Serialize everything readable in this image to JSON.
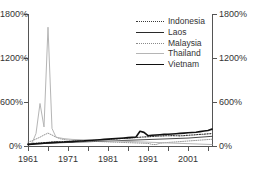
{
  "chart_data": {
    "type": "line",
    "title": "",
    "xlabel": "",
    "ylabel": "",
    "xlim": [
      1961,
      2007
    ],
    "ylim": [
      0,
      1800
    ],
    "grid": false,
    "legend_position": "top-right",
    "y_unit": "%",
    "y_ticks": [
      0,
      600,
      1200,
      1800
    ],
    "y_tick_labels_left": [
      "0%",
      "600%",
      "1200%",
      "1800%"
    ],
    "y_tick_labels_right": [
      "0%",
      "600%",
      "1200%",
      "1800%"
    ],
    "x_ticks": [
      1961,
      1966,
      1971,
      1976,
      1981,
      1986,
      1991,
      1996,
      2001,
      2006
    ],
    "x_tick_labels": [
      "1961",
      "",
      "1971",
      "",
      "1981",
      "",
      "1991",
      "",
      "2001",
      ""
    ],
    "x_labels_shown": [
      "1961",
      "1971",
      "1981",
      "1991",
      "2001"
    ],
    "x": [
      1961,
      1962,
      1963,
      1964,
      1965,
      1966,
      1967,
      1968,
      1969,
      1970,
      1971,
      1972,
      1973,
      1974,
      1975,
      1976,
      1977,
      1978,
      1979,
      1980,
      1981,
      1982,
      1983,
      1984,
      1985,
      1986,
      1987,
      1988,
      1989,
      1990,
      1991,
      1992,
      1993,
      1994,
      1995,
      1996,
      1997,
      1998,
      1999,
      2000,
      2001,
      2002,
      2003,
      2004,
      2005,
      2006,
      2007
    ],
    "series": [
      {
        "name": "Indonesia",
        "style": "dotted",
        "color": "#3a3a3a",
        "width": 1.1,
        "values": [
          30,
          34,
          38,
          42,
          46,
          50,
          54,
          56,
          58,
          60,
          62,
          64,
          66,
          68,
          70,
          72,
          74,
          78,
          82,
          86,
          88,
          92,
          96,
          100,
          104,
          108,
          112,
          116,
          120,
          124,
          126,
          130,
          134,
          136,
          138,
          140,
          142,
          140,
          138,
          142,
          146,
          150,
          154,
          158,
          162,
          166,
          170
        ]
      },
      {
        "name": "Laos",
        "style": "solid",
        "color": "#2a2a2a",
        "width": 0.85,
        "values": [
          18,
          22,
          26,
          30,
          34,
          38,
          40,
          42,
          44,
          46,
          48,
          50,
          52,
          54,
          56,
          58,
          60,
          62,
          64,
          66,
          68,
          70,
          72,
          74,
          76,
          78,
          80,
          82,
          84,
          86,
          88,
          90,
          92,
          94,
          96,
          98,
          100,
          102,
          104,
          106,
          108,
          112,
          116,
          120,
          124,
          128,
          132
        ]
      },
      {
        "name": "Malaysia",
        "style": "dotted-fine",
        "color": "#8a8a8a",
        "width": 0.9,
        "values": [
          55,
          70,
          95,
          120,
          150,
          175,
          150,
          120,
          100,
          88,
          80,
          76,
          72,
          70,
          68,
          66,
          64,
          62,
          60,
          58,
          56,
          54,
          52,
          50,
          48,
          46,
          44,
          42,
          40,
          38,
          36,
          22,
          20,
          38,
          44,
          48,
          52,
          56,
          60,
          64,
          68,
          72,
          76,
          80,
          84,
          88,
          92
        ]
      },
      {
        "name": "Thailand",
        "style": "solid",
        "color": "#b5b5b5",
        "width": 1.0,
        "values": [
          20,
          40,
          170,
          580,
          260,
          1620,
          240,
          120,
          110,
          100,
          95,
          90,
          88,
          86,
          84,
          82,
          80,
          78,
          76,
          74,
          72,
          70,
          68,
          66,
          64,
          62,
          60,
          58,
          56,
          54,
          52,
          50,
          48,
          46,
          44,
          42,
          40,
          38,
          36,
          34,
          32,
          30,
          28,
          26,
          24,
          22,
          20
        ]
      },
      {
        "name": "Vietnam",
        "style": "solid",
        "color": "#111111",
        "width": 1.6,
        "values": [
          22,
          26,
          30,
          34,
          38,
          42,
          46,
          50,
          52,
          54,
          58,
          60,
          64,
          68,
          70,
          74,
          78,
          82,
          86,
          90,
          94,
          98,
          102,
          106,
          110,
          114,
          118,
          122,
          200,
          186,
          140,
          146,
          150,
          154,
          158,
          160,
          164,
          168,
          172,
          176,
          180,
          184,
          188,
          196,
          204,
          212,
          230
        ]
      }
    ]
  },
  "legend": {
    "items": [
      {
        "label": "Indonesia"
      },
      {
        "label": "Laos"
      },
      {
        "label": "Malaysia"
      },
      {
        "label": "Thailand"
      },
      {
        "label": "Vietnam"
      }
    ]
  }
}
